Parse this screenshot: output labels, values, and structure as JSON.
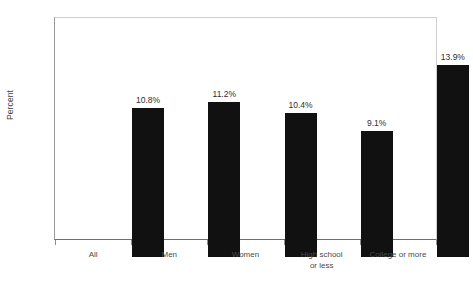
{
  "chart_data": {
    "type": "bar",
    "title": "",
    "xlabel": "",
    "ylabel": "Percent",
    "categories": [
      "All",
      "Men",
      "Women",
      "High school or less",
      "College or more"
    ],
    "category_lines": [
      [
        "All"
      ],
      [
        "Men"
      ],
      [
        "Women"
      ],
      [
        "High school",
        "or less"
      ],
      [
        "College or more"
      ]
    ],
    "values": [
      10.8,
      11.2,
      10.4,
      9.1,
      13.9
    ],
    "value_labels": [
      "10.8%",
      "11.2%",
      "10.4%",
      "9.1%",
      "13.9%"
    ],
    "ylim": [
      0,
      16
    ],
    "ytick_values": [
      0,
      2,
      4,
      6,
      8,
      10,
      12,
      14,
      16
    ],
    "ytick_labels": [
      "0%",
      "2%",
      "4%",
      "6%",
      "8%",
      "10%",
      "12%",
      "14%",
      "16%"
    ],
    "grid": false,
    "legend": null,
    "bar_color": "#111111",
    "axis_color": "#6e6e6e",
    "label_color": "#4a4a4a"
  },
  "source_note": ""
}
